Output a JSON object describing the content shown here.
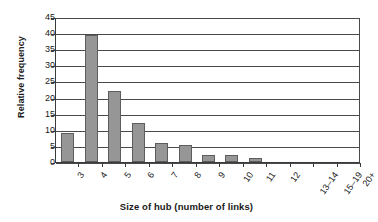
{
  "chart_data": {
    "type": "bar",
    "title": "",
    "xlabel": "Size of hub (number of links)",
    "ylabel": "Relative frequency",
    "categories": [
      "3",
      "4",
      "5",
      "6",
      "7",
      "8",
      "9",
      "10",
      "11",
      "12",
      "13–14",
      "15–19",
      "20+"
    ],
    "values": [
      9,
      39.5,
      22,
      12,
      6,
      5.2,
      2.2,
      2.2,
      1.3,
      0,
      0,
      0,
      0
    ],
    "ylim": [
      0,
      45
    ],
    "ytick_labels": [
      "0",
      "5",
      "10",
      "15",
      "20",
      "25",
      "30",
      "35",
      "40",
      "45"
    ],
    "ytick_values": [
      0,
      5,
      10,
      15,
      20,
      25,
      30,
      35,
      40,
      45
    ],
    "grid": true,
    "legend": false,
    "bar_color": "#969696",
    "bar_border_color": "#5d5d5d",
    "axis_color": "#3a3a3a",
    "grid_color": "#4a4a4a",
    "text_color": "#1a1a1a"
  }
}
